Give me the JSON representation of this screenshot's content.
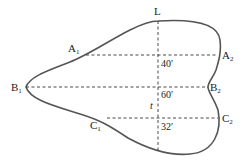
{
  "diagram": {
    "labels": {
      "L": "L",
      "A1": {
        "base": "A",
        "sub": "1"
      },
      "A2": {
        "base": "A",
        "sub": "2"
      },
      "B1": {
        "base": "B",
        "sub": "1"
      },
      "B2": {
        "base": "B",
        "sub": "2"
      },
      "C1": {
        "base": "C",
        "sub": "1"
      },
      "C2": {
        "base": "C",
        "sub": "2"
      },
      "t": "t"
    },
    "dimensions": {
      "A": "40′",
      "B": "60′",
      "C": "32′"
    },
    "colors": {
      "outline": "#555555",
      "dashed": "#333333",
      "text": "#222222"
    }
  }
}
